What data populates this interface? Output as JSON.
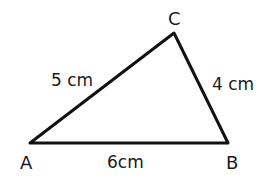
{
  "diagram": {
    "type": "triangle",
    "stroke_color": "#111111",
    "vertices": {
      "A": {
        "label": "A"
      },
      "B": {
        "label": "B"
      },
      "C": {
        "label": "C"
      }
    },
    "sides": {
      "AC": {
        "label": "5 cm",
        "length_cm": 5
      },
      "CB": {
        "label": "4 cm",
        "length_cm": 4
      },
      "AB": {
        "label": "6cm",
        "length_cm": 6
      }
    }
  }
}
